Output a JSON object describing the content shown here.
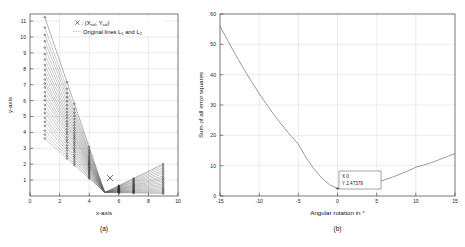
{
  "figure": {
    "panels": [
      {
        "id": "a",
        "caption": "(a)",
        "xlabel": "x-axis",
        "ylabel": "y-axis"
      },
      {
        "id": "b",
        "caption": "(b)",
        "xlabel": "Angular rotation in °",
        "ylabel": "Sum of all error squares"
      }
    ]
  },
  "panel_a": {
    "legend": {
      "marker_symbol": "✕",
      "entry1_prefix": ": (X",
      "entry1_sub1": "sol",
      "entry1_mid": ", Y",
      "entry1_sub2": "sol",
      "entry1_suffix": ")",
      "entry2_prefix": "Original lines L",
      "entry2_sub1": "1",
      "entry2_mid": " and L",
      "entry2_sub2": "2"
    },
    "xticks": [
      "0",
      "2",
      "4",
      "6",
      "8",
      "10"
    ],
    "yticks": [
      "1",
      "2",
      "3",
      "4",
      "5",
      "6",
      "7",
      "8",
      "9",
      "10",
      "11"
    ]
  },
  "panel_b": {
    "xticks": [
      "-15",
      "-10",
      "-5",
      "0",
      "5",
      "10",
      "15"
    ],
    "yticks": [
      "0",
      "10",
      "20",
      "30",
      "40",
      "50",
      "60"
    ],
    "datatip": {
      "x_label": "X 0",
      "y_label": "Y 2.47379"
    }
  },
  "chart_data": [
    {
      "type": "scatter",
      "id": "panel-a",
      "title": "",
      "xlabel": "x-axis",
      "ylabel": "y-axis",
      "xlim": [
        0,
        10
      ],
      "ylim": [
        0.4,
        11.8
      ],
      "xticks": [
        0,
        2,
        4,
        6,
        8,
        10
      ],
      "yticks": [
        1,
        2,
        3,
        4,
        5,
        6,
        7,
        8,
        9,
        10,
        11
      ],
      "grid": true,
      "legend_position": "top-center",
      "legend_entries": [
        "✕: (Xsol, Ysol)",
        "Original lines L1 and L2"
      ],
      "annotations": [
        {
          "label": "solution marker",
          "x": 5.5,
          "y": 1.15,
          "symbol": "✕"
        },
        {
          "label": "convergence point",
          "x": 5.05,
          "y": 0.62
        }
      ],
      "description": "Two fans of straight lines. Left fan: lines from a dense cluster of points at x=1 (y from 4.0 to 11.6) converging toward a common point near (5.05, 0.62), with intermediate point clusters at x=2.5 and x=3. Right fan: lines from the convergence region spreading out to a cluster of points at x=9 (y from 0.55 to 2.4).",
      "left_fan": {
        "origin_x": 1.0,
        "origin_y_values": [
          4.0,
          4.25,
          4.5,
          4.8,
          5.05,
          5.3,
          5.6,
          5.85,
          6.1,
          6.4,
          6.65,
          6.9,
          7.2,
          7.45,
          7.7,
          8.0,
          8.3,
          8.6,
          8.95,
          9.3,
          9.7,
          10.1,
          10.5,
          10.95,
          11.6
        ],
        "converge_x": 5.05,
        "converge_y": 0.62
      },
      "right_fan": {
        "origin_x": 5.05,
        "origin_y": 0.62,
        "end_x": 9.0,
        "end_y_values": [
          0.55,
          0.62,
          0.7,
          0.78,
          0.86,
          0.95,
          1.05,
          1.15,
          1.25,
          1.35,
          1.45,
          1.55,
          1.65,
          1.78,
          1.9,
          2.02,
          2.15,
          2.28,
          2.4
        ]
      },
      "mid_clusters_x": [
        2.5,
        3.0,
        4.0,
        6.0,
        7.0
      ]
    },
    {
      "type": "line",
      "id": "panel-b",
      "title": "",
      "xlabel": "Angular rotation in °",
      "ylabel": "Sum of all error squares",
      "xlim": [
        -15,
        15
      ],
      "ylim": [
        0,
        60
      ],
      "xticks": [
        -15,
        -10,
        -5,
        0,
        5,
        10,
        15
      ],
      "yticks": [
        0,
        10,
        20,
        30,
        40,
        50,
        60
      ],
      "grid": true,
      "legend_position": "none",
      "x": [
        -15,
        -14,
        -13,
        -12,
        -11,
        -10,
        -9,
        -8,
        -7,
        -6,
        -5,
        -4,
        -3,
        -2,
        -1,
        0,
        1,
        2,
        3,
        4,
        5,
        6,
        7,
        8,
        9,
        10,
        11,
        12,
        13,
        14,
        15
      ],
      "values": [
        56.0,
        51.2,
        46.5,
        42.0,
        37.8,
        33.8,
        30.0,
        26.4,
        23.1,
        20.0,
        17.1,
        12.6,
        8.9,
        5.9,
        3.7,
        2.47,
        2.6,
        2.9,
        3.3,
        3.8,
        4.5,
        5.3,
        6.2,
        7.2,
        8.3,
        9.5,
        10.2,
        11.0,
        12.0,
        13.0,
        14.0
      ],
      "annotations": [
        {
          "type": "datatip",
          "x": 0,
          "y": 2.47379,
          "text_lines": [
            "X 0",
            "Y 2.47379"
          ]
        }
      ]
    }
  ]
}
